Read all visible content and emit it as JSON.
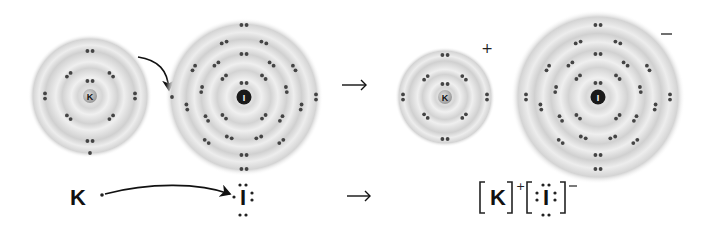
{
  "reactants": {
    "potassium_atom": {
      "symbol": "K",
      "center": [
        90,
        96
      ],
      "shell_radii": [
        15,
        30,
        45,
        57
      ],
      "outer_radius": 62,
      "electrons_per_shell": [
        2,
        8,
        8,
        1
      ]
    },
    "iodine_atom": {
      "symbol": "I",
      "center": [
        244,
        97
      ],
      "shell_radii": [
        14,
        28,
        43,
        58,
        72
      ],
      "outer_radius": 79,
      "electrons_per_shell": [
        2,
        8,
        18,
        18,
        7
      ]
    },
    "transfer_arrow": "K valence electron moves to I outer shell"
  },
  "reaction_arrow": "→",
  "products": {
    "potassium_ion": {
      "symbol": "K",
      "charge": "+",
      "center": [
        445,
        97
      ],
      "shell_radii": [
        13,
        27,
        42
      ],
      "outer_radius": 50,
      "electrons_per_shell": [
        2,
        8,
        8
      ]
    },
    "iodide_ion": {
      "symbol": "I",
      "charge": "−",
      "center": [
        598,
        97
      ],
      "shell_radii": [
        14,
        28,
        43,
        58,
        72
      ],
      "outer_radius": 87,
      "electrons_per_shell": [
        2,
        8,
        18,
        18,
        8
      ]
    }
  },
  "lewis": {
    "left": {
      "k_symbol": "K",
      "i_symbol": "I"
    },
    "arrow": "→",
    "right": {
      "k_symbol": "K",
      "k_charge": "+",
      "i_symbol": "I",
      "i_charge": "−"
    }
  },
  "colors": {
    "shell_dark": "#c8c8c8",
    "shell_light": "#f2f2f2",
    "electron": "#444444",
    "k_nucleus": "#b0b0b0",
    "i_nucleus": "#1a1a1a"
  }
}
